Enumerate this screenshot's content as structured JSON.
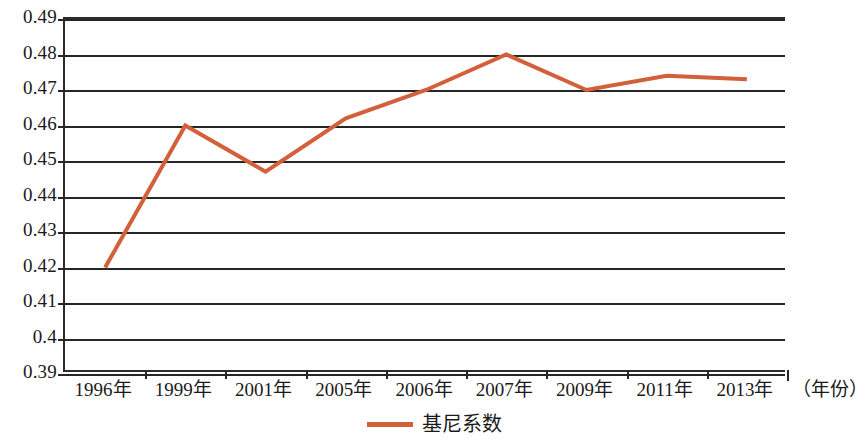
{
  "chart_data": {
    "type": "line",
    "title": "",
    "xlabel": "（年份）",
    "ylabel": "",
    "categories": [
      "1996年",
      "1999年",
      "2001年",
      "2005年",
      "2006年",
      "2007年",
      "2009年",
      "2011年",
      "2013年"
    ],
    "series": [
      {
        "name": "基尼系数",
        "color": "#d2603a",
        "values": [
          0.42,
          0.46,
          0.447,
          0.462,
          0.47,
          0.48,
          0.47,
          0.474,
          0.473
        ]
      }
    ],
    "ylim": [
      0.39,
      0.49
    ],
    "y_ticks": [
      "0.49",
      "0.48",
      "0.47",
      "0.46",
      "0.45",
      "0.44",
      "0.43",
      "0.42",
      "0.41",
      "0.4",
      "0.39"
    ],
    "y_tick_values": [
      0.49,
      0.48,
      0.47,
      0.46,
      0.45,
      0.44,
      0.43,
      0.42,
      0.41,
      0.4,
      0.39
    ],
    "grid": true,
    "legend": {
      "position": "bottom",
      "entries": [
        "基尼系数"
      ]
    },
    "axis_color": "#262626",
    "line_width": 4
  }
}
